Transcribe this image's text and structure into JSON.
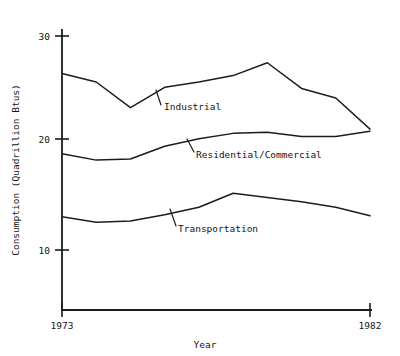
{
  "chart_data": {
    "type": "line",
    "title": "",
    "xlabel": "Year",
    "ylabel": "Consumption (Quadrillion Btus)",
    "xlim": [
      1973,
      1982
    ],
    "ylim": [
      7.5,
      31
    ],
    "grid": false,
    "legend_position": "inline-annotations",
    "y_ticks": [
      {
        "value": 30,
        "label": "30"
      },
      {
        "value": 20,
        "label": "20"
      },
      {
        "value": 10,
        "label": "10"
      }
    ],
    "x_ticks": [
      {
        "value": 1973,
        "label": "1973"
      },
      {
        "value": 1982,
        "label": "1982"
      }
    ],
    "series": [
      {
        "name": "Industrial",
        "label": "Industrial",
        "color": "#1c1c1c",
        "x": [
          1973,
          1974,
          1975,
          1976,
          1977,
          1978,
          1979,
          1980,
          1981,
          1982
        ],
        "values": [
          26.5,
          25.7,
          23.3,
          25.2,
          25.7,
          26.3,
          27.5,
          25.1,
          24.2,
          21.3
        ]
      },
      {
        "name": "Residential/Commercial",
        "label": "Residential/Commercial",
        "color": "#1c1c1c",
        "x": [
          1973,
          1974,
          1975,
          1976,
          1977,
          1978,
          1979,
          1980,
          1981,
          1982
        ],
        "values": [
          19.0,
          18.4,
          18.5,
          19.7,
          20.4,
          20.9,
          21.0,
          20.6,
          20.6,
          21.1
        ]
      },
      {
        "name": "Transportation",
        "label": "Transportation",
        "color": "#1c1c1c",
        "x": [
          1973,
          1974,
          1975,
          1976,
          1977,
          1978,
          1979,
          1980,
          1981,
          1982
        ],
        "values": [
          13.1,
          12.6,
          12.7,
          13.3,
          14.0,
          15.3,
          14.9,
          14.5,
          14.0,
          13.2
        ]
      }
    ],
    "annotations": [
      {
        "name": "industrial-annotation",
        "text": "Industrial",
        "x": 164,
        "y": 108
      },
      {
        "name": "residential-annotation",
        "text": "Residential/Commercial",
        "x": 196,
        "y": 156
      },
      {
        "name": "transportation-annotation",
        "text": "Transportation",
        "x": 178,
        "y": 230
      }
    ]
  },
  "axes": {
    "y_title": "Consumption (Quadrillion Btus)",
    "x_title": "Year",
    "y_tick_labels": [
      "30",
      "20",
      "10"
    ],
    "x_tick_labels": [
      "1973",
      "1982"
    ]
  }
}
